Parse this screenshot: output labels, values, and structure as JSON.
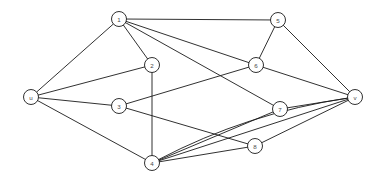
{
  "figure": {
    "name": "undirected-graph-diagram",
    "background_color": "#ffffff",
    "line_color": "#1a1a1a",
    "node_fill_color": "#ffffff",
    "label_color": "#4a4a4a",
    "node_radius": 7.5,
    "canvas": {
      "width": 382,
      "height": 185
    }
  },
  "nodes": [
    {
      "id": "u",
      "label": "u",
      "x": 31,
      "y": 97
    },
    {
      "id": "1",
      "label": "1",
      "x": 119,
      "y": 19
    },
    {
      "id": "2",
      "label": "2",
      "x": 152,
      "y": 65
    },
    {
      "id": "3",
      "label": "3",
      "x": 119,
      "y": 106
    },
    {
      "id": "4",
      "label": "4",
      "x": 152,
      "y": 163
    },
    {
      "id": "5",
      "label": "5",
      "x": 278,
      "y": 20
    },
    {
      "id": "6",
      "label": "6",
      "x": 256,
      "y": 65
    },
    {
      "id": "7",
      "label": "7",
      "x": 280,
      "y": 109
    },
    {
      "id": "8",
      "label": "8",
      "x": 255,
      "y": 146
    },
    {
      "id": "v",
      "label": "v",
      "x": 355,
      "y": 97
    }
  ],
  "edges": [
    {
      "id": "u-1",
      "from": "u",
      "to": "1",
      "shape": "straight"
    },
    {
      "id": "u-2",
      "from": "u",
      "to": "2",
      "shape": "straight"
    },
    {
      "id": "u-3",
      "from": "u",
      "to": "3",
      "shape": "straight"
    },
    {
      "id": "u-4",
      "from": "u",
      "to": "4",
      "shape": "straight"
    },
    {
      "id": "1-5",
      "from": "1",
      "to": "5",
      "shape": "straight"
    },
    {
      "id": "1-2",
      "from": "1",
      "to": "2",
      "shape": "straight"
    },
    {
      "id": "1-6",
      "from": "1",
      "to": "6",
      "shape": "straight"
    },
    {
      "id": "1-7",
      "from": "1",
      "to": "7",
      "shape": "straight"
    },
    {
      "id": "2-4",
      "from": "2",
      "to": "4",
      "shape": "straight"
    },
    {
      "id": "3-6",
      "from": "3",
      "to": "6",
      "shape": "straight"
    },
    {
      "id": "3-8",
      "from": "3",
      "to": "8",
      "shape": "straight"
    },
    {
      "id": "4-7",
      "from": "4",
      "to": "7",
      "shape": "straight"
    },
    {
      "id": "4-8",
      "from": "4",
      "to": "8",
      "shape": "straight"
    },
    {
      "id": "4-v-straight",
      "from": "4",
      "to": "v",
      "shape": "straight"
    },
    {
      "id": "4-v-curved",
      "from": "4",
      "to": "v",
      "shape": "curved",
      "curve_offset": 18
    },
    {
      "id": "5-6",
      "from": "5",
      "to": "6",
      "shape": "straight"
    },
    {
      "id": "5-v",
      "from": "5",
      "to": "v",
      "shape": "straight"
    },
    {
      "id": "6-v",
      "from": "6",
      "to": "v",
      "shape": "straight"
    },
    {
      "id": "7-v",
      "from": "7",
      "to": "v",
      "shape": "straight"
    },
    {
      "id": "8-v",
      "from": "8",
      "to": "v",
      "shape": "straight"
    }
  ]
}
